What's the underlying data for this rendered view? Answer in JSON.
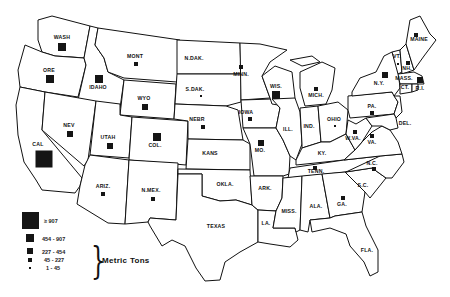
{
  "map": {
    "title": "",
    "units_label": "Metric Tons",
    "legend": [
      {
        "label": "≥ 907",
        "size": 17
      },
      {
        "label": "454 - 907",
        "size": 8
      },
      {
        "label": "227 - 454",
        "size": 6
      },
      {
        "label": "45 - 227",
        "size": 4
      },
      {
        "label": "1 - 45",
        "size": 2
      }
    ],
    "states": [
      {
        "id": "WASH",
        "label": "WASH",
        "lx": 62,
        "ly": 38,
        "mx": 62,
        "my": 47,
        "size": 8,
        "class": "454-907"
      },
      {
        "id": "ORE",
        "label": "ORE",
        "lx": 49,
        "ly": 71,
        "mx": 50,
        "my": 79,
        "size": 8,
        "class": "454-907"
      },
      {
        "id": "IDAHO",
        "label": "IDAHO",
        "lx": 98,
        "ly": 88,
        "mx": 99,
        "my": 79,
        "size": 8,
        "class": "454-907"
      },
      {
        "id": "MONT",
        "label": "MONT",
        "lx": 135,
        "ly": 57,
        "mx": 136,
        "my": 64,
        "size": 4,
        "class": "45-227"
      },
      {
        "id": "WYO",
        "label": "WYO",
        "lx": 144,
        "ly": 99,
        "mx": 145,
        "my": 107,
        "size": 6,
        "class": "227-454"
      },
      {
        "id": "CAL",
        "label": "CAL",
        "lx": 38,
        "ly": 145,
        "mx": 44,
        "my": 159,
        "size": 17,
        "class": ">=907"
      },
      {
        "id": "NEV",
        "label": "NEV",
        "lx": 69,
        "ly": 126,
        "mx": 70,
        "my": 134,
        "size": 6,
        "class": "227-454"
      },
      {
        "id": "UTAH",
        "label": "UTAH",
        "lx": 108,
        "ly": 138,
        "mx": 110,
        "my": 146,
        "size": 6,
        "class": "227-454"
      },
      {
        "id": "COL",
        "label": "COL.",
        "lx": 155,
        "ly": 146,
        "mx": 157,
        "my": 137,
        "size": 8,
        "class": "454-907"
      },
      {
        "id": "ARIZ",
        "label": "ARIZ.",
        "lx": 103,
        "ly": 187,
        "mx": 103,
        "my": 194,
        "size": 4,
        "class": "45-227"
      },
      {
        "id": "NMEX",
        "label": "N.MEX.",
        "lx": 151,
        "ly": 191,
        "mx": 153,
        "my": 199,
        "size": 4,
        "class": "45-227"
      },
      {
        "id": "NDAK",
        "label": "N.DAK.",
        "lx": 194,
        "ly": 59,
        "mx": null,
        "my": null,
        "size": 0,
        "class": "none"
      },
      {
        "id": "SDAK",
        "label": "S.DAK.",
        "lx": 195,
        "ly": 90,
        "mx": 201,
        "my": 96,
        "size": 2,
        "class": "1-45"
      },
      {
        "id": "NEBR",
        "label": "NEBR",
        "lx": 197,
        "ly": 120,
        "mx": 203,
        "my": 127,
        "size": 4,
        "class": "45-227"
      },
      {
        "id": "KANS",
        "label": "KANS",
        "lx": 210,
        "ly": 154,
        "mx": null,
        "my": null,
        "size": 0,
        "class": "none"
      },
      {
        "id": "OKLA",
        "label": "OKLA.",
        "lx": 225,
        "ly": 185,
        "mx": null,
        "my": null,
        "size": 0,
        "class": "none"
      },
      {
        "id": "TEXAS",
        "label": "TEXAS",
        "lx": 216,
        "ly": 227,
        "mx": null,
        "my": null,
        "size": 0,
        "class": "none"
      },
      {
        "id": "MINN",
        "label": "MINN.",
        "lx": 241,
        "ly": 75,
        "mx": 241,
        "my": 67,
        "size": 4,
        "class": "45-227"
      },
      {
        "id": "IOWA",
        "label": "IOWA",
        "lx": 246,
        "ly": 113,
        "mx": 250,
        "my": 119,
        "size": 4,
        "class": "45-227"
      },
      {
        "id": "MO",
        "label": "MO.",
        "lx": 260,
        "ly": 151,
        "mx": 261,
        "my": 143,
        "size": 6,
        "class": "227-454"
      },
      {
        "id": "ARK",
        "label": "ARK.",
        "lx": 265,
        "ly": 189,
        "mx": null,
        "my": null,
        "size": 0,
        "class": "none"
      },
      {
        "id": "LA",
        "label": "LA.",
        "lx": 266,
        "ly": 224,
        "mx": null,
        "my": null,
        "size": 0,
        "class": "none"
      },
      {
        "id": "WIS",
        "label": "WIS.",
        "lx": 276,
        "ly": 87,
        "mx": 276,
        "my": 95,
        "size": 8,
        "class": "454-907"
      },
      {
        "id": "ILL",
        "label": "ILL.",
        "lx": 288,
        "ly": 130,
        "mx": null,
        "my": null,
        "size": 0,
        "class": "none"
      },
      {
        "id": "MICH",
        "label": "MICH.",
        "lx": 316,
        "ly": 96,
        "mx": 316,
        "my": 89,
        "size": 4,
        "class": "45-227"
      },
      {
        "id": "IND",
        "label": "IND.",
        "lx": 309,
        "ly": 127,
        "mx": null,
        "my": null,
        "size": 0,
        "class": "none"
      },
      {
        "id": "OHIO",
        "label": "OHIO",
        "lx": 334,
        "ly": 120,
        "mx": 335,
        "my": 126,
        "size": 2,
        "class": "1-45"
      },
      {
        "id": "KY",
        "label": "KY.",
        "lx": 322,
        "ly": 154,
        "mx": null,
        "my": null,
        "size": 0,
        "class": "none"
      },
      {
        "id": "TENN",
        "label": "TENN.",
        "lx": 316,
        "ly": 172,
        "mx": 315,
        "my": 168,
        "size": 4,
        "class": "45-227"
      },
      {
        "id": "MISS",
        "label": "MISS.",
        "lx": 289,
        "ly": 212,
        "mx": null,
        "my": null,
        "size": 0,
        "class": "none"
      },
      {
        "id": "ALA",
        "label": "ALA.",
        "lx": 316,
        "ly": 207,
        "mx": null,
        "my": null,
        "size": 0,
        "class": "none"
      },
      {
        "id": "GA",
        "label": "GA.",
        "lx": 342,
        "ly": 205,
        "mx": 343,
        "my": 198,
        "size": 4,
        "class": "45-227"
      },
      {
        "id": "FLA",
        "label": "FLA.",
        "lx": 367,
        "ly": 251,
        "mx": null,
        "my": null,
        "size": 0,
        "class": "none"
      },
      {
        "id": "SC",
        "label": "S.C.",
        "lx": 363,
        "ly": 186,
        "mx": null,
        "my": null,
        "size": 0,
        "class": "none"
      },
      {
        "id": "NC",
        "label": "N.C.",
        "lx": 372,
        "ly": 164,
        "mx": 374,
        "my": 169,
        "size": 4,
        "class": "45-227"
      },
      {
        "id": "VA",
        "label": "VA.",
        "lx": 372,
        "ly": 143,
        "mx": 372,
        "my": 136,
        "size": 4,
        "class": "45-227"
      },
      {
        "id": "WVA",
        "label": "W.VA.",
        "lx": 353,
        "ly": 139,
        "mx": 355,
        "my": 132,
        "size": 4,
        "class": "45-227"
      },
      {
        "id": "PA",
        "label": "PA.",
        "lx": 372,
        "ly": 107,
        "mx": 372,
        "my": 113,
        "size": 4,
        "class": "45-227"
      },
      {
        "id": "NY",
        "label": "N.Y.",
        "lx": 379,
        "ly": 84,
        "mx": 385,
        "my": 75,
        "size": 6,
        "class": "227-454"
      },
      {
        "id": "VT",
        "label": "VT.",
        "lx": 397,
        "ly": 57,
        "mx": 398,
        "my": 64,
        "size": 2,
        "class": "1-45"
      },
      {
        "id": "NH",
        "label": "NH.",
        "lx": 407,
        "ly": 69,
        "mx": 408,
        "my": 63,
        "size": 4,
        "class": "45-227"
      },
      {
        "id": "MAINE",
        "label": "MAINE",
        "lx": 419,
        "ly": 40,
        "mx": 416,
        "my": 35,
        "size": 4,
        "class": "45-227"
      },
      {
        "id": "MASS",
        "label": "MASS.",
        "lx": 404,
        "ly": 79,
        "mx": 420,
        "my": 80,
        "size": 6,
        "class": "227-454"
      },
      {
        "id": "CT",
        "label": "CT.",
        "lx": 405,
        "ly": 88,
        "mx": null,
        "my": null,
        "size": 0,
        "class": "none"
      },
      {
        "id": "RI",
        "label": "R.I.",
        "lx": 420,
        "ly": 89,
        "mx": null,
        "my": null,
        "size": 0,
        "class": "none"
      },
      {
        "id": "DEL",
        "label": "DEL.",
        "lx": 405,
        "ly": 124,
        "mx": null,
        "my": null,
        "size": 0,
        "class": "none"
      }
    ]
  }
}
